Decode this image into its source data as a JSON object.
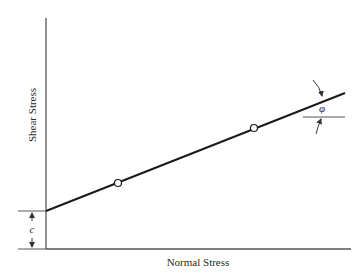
{
  "diagram": {
    "type": "Mohr-Coulomb failure envelope",
    "x_axis_label": "Normal Stress",
    "y_axis_label": "Shear Stress",
    "intercept_label": "c",
    "angle_label": "φ",
    "points": [
      {
        "name": "test-point-1",
        "cx": 118,
        "cy": 183
      },
      {
        "name": "test-point-2",
        "cx": 254,
        "cy": 128
      }
    ],
    "colors": {
      "axis": "#555555",
      "envelope": "#1a1a1a",
      "text": "#2a2a2a",
      "background": "#ffffff"
    }
  }
}
